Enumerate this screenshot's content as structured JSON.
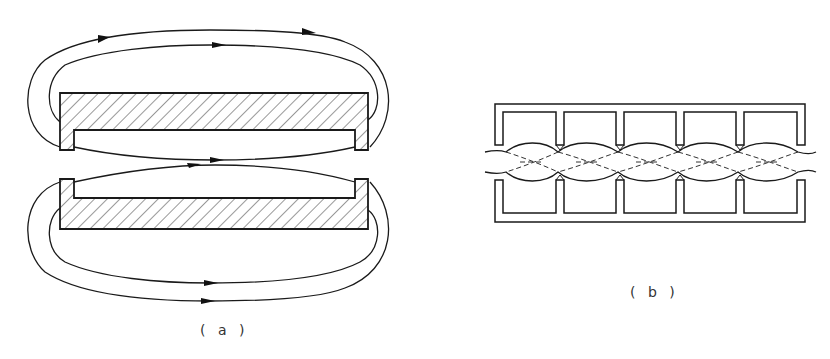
{
  "figure": {
    "panel_a": {
      "label": "( a )",
      "description": "Two opposed U-shaped magnets with hatched cross-section and flux lines with arrows",
      "stroke_color": "#1a1a1a"
    },
    "panel_b": {
      "label": "( b )",
      "description": "Periodic multi-pole magnet structure (5 cells) with flux lines in the gap",
      "cells": 5,
      "stroke_color": "#1a1a1a"
    }
  }
}
